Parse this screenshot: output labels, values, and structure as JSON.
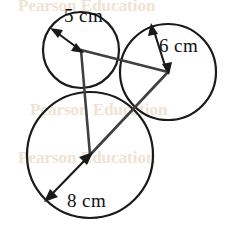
{
  "figure": {
    "type": "geometry-diagram",
    "width": 229,
    "height": 239,
    "background_color": "#ffffff",
    "stroke_color": "#1a1a1a",
    "triangle_color": "#404040"
  },
  "circles": [
    {
      "id": "small-circle",
      "label": "5 cm",
      "radius_value": 5,
      "unit": "cm",
      "center_x": 81,
      "center_y": 50,
      "pixel_radius": 38,
      "stroke_width": 2.2,
      "label_x": 64,
      "label_y": 22,
      "arrow_from_x": 81,
      "arrow_from_y": 50,
      "arrow_to_x": 54,
      "arrow_to_y": 30
    },
    {
      "id": "medium-circle",
      "label": "6 cm",
      "radius_value": 6,
      "unit": "cm",
      "center_x": 168,
      "center_y": 72,
      "pixel_radius": 48,
      "stroke_width": 2.2,
      "label_x": 159,
      "label_y": 52,
      "arrow_from_x": 168,
      "arrow_from_y": 72,
      "arrow_to_x": 152,
      "arrow_to_y": 26
    },
    {
      "id": "large-circle",
      "label": "8 cm",
      "radius_value": 8,
      "unit": "cm",
      "center_x": 90,
      "center_y": 155,
      "pixel_radius": 63,
      "stroke_width": 2.2,
      "label_x": 67,
      "label_y": 207,
      "arrow_from_x": 90,
      "arrow_from_y": 155,
      "arrow_to_x": 46,
      "arrow_to_y": 200
    }
  ],
  "triangle": {
    "name": "center-triangle",
    "stroke_width": 2.6,
    "vertices": [
      {
        "name": "small-center",
        "x": 81,
        "y": 50
      },
      {
        "name": "medium-center",
        "x": 168,
        "y": 72
      },
      {
        "name": "large-center",
        "x": 90,
        "y": 155
      }
    ],
    "sides": [
      {
        "name": "side-small-to-medium",
        "from": 0,
        "to": 1,
        "length_cm": 11
      },
      {
        "name": "side-medium-to-large",
        "from": 1,
        "to": 2,
        "length_cm": 14
      },
      {
        "name": "side-large-to-small",
        "from": 2,
        "to": 0,
        "length_cm": 13
      }
    ]
  },
  "watermarks": [
    {
      "text": "Pearson Education",
      "x": 18,
      "y": -4
    },
    {
      "text": "Pearson Education",
      "x": 30,
      "y": 100
    },
    {
      "text": "Pearson Education",
      "x": 18,
      "y": 148
    }
  ]
}
